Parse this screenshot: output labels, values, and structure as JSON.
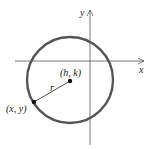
{
  "diagram": {
    "axes": {
      "x_label": "x",
      "y_label": "y"
    },
    "circle": {
      "center_label": "(h, k)",
      "point_label": "(x, y)",
      "radius_label": "r",
      "stroke_color": "#555555"
    },
    "axis_color": "#555555"
  }
}
